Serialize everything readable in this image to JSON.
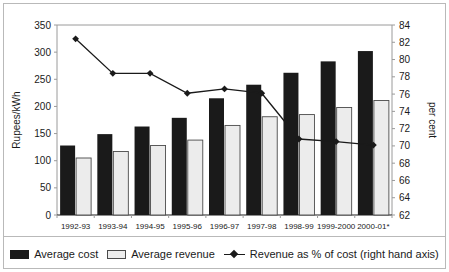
{
  "chart_data": {
    "type": "bar",
    "title": "",
    "xlabel": "",
    "ylabel": "Rupees/kWh",
    "y2label": "per cent",
    "categories": [
      "1992-93",
      "1993-94",
      "1994-95",
      "1995-96",
      "1996-97",
      "1997-98",
      "1998-99",
      "1999-2000",
      "2000-01*"
    ],
    "ylim": [
      0,
      350
    ],
    "yticks": [
      0,
      50,
      100,
      150,
      200,
      250,
      300,
      350
    ],
    "y2lim": [
      62,
      84
    ],
    "y2ticks": [
      62,
      64,
      66,
      68,
      70,
      72,
      74,
      76,
      78,
      80,
      82,
      84
    ],
    "grid": false,
    "legend_position": "bottom",
    "series": [
      {
        "name": "Average cost",
        "kind": "bar",
        "axis": "left",
        "color": "#1a1a1a",
        "values": [
          128,
          149,
          163,
          179,
          215,
          240,
          262,
          283,
          302
        ]
      },
      {
        "name": "Average revenue",
        "kind": "bar",
        "axis": "left",
        "color": "#ececec",
        "values": [
          105,
          117,
          128,
          138,
          165,
          181,
          185,
          198,
          211
        ]
      },
      {
        "name": "Revenue as % of cost (right hand axis)",
        "kind": "line",
        "axis": "right",
        "color": "#1a1a1a",
        "marker": "diamond",
        "values": [
          82.4,
          78.4,
          78.4,
          76.1,
          76.6,
          76.1,
          70.8,
          70.5,
          70.1
        ]
      }
    ]
  },
  "legend": {
    "items": [
      {
        "label": "Average cost",
        "swatch": "dark-bar-swatch"
      },
      {
        "label": "Average revenue",
        "swatch": "light-bar-swatch"
      },
      {
        "label": "Revenue as % of cost (right hand axis)",
        "swatch": "line-marker-swatch"
      }
    ]
  },
  "colors": {
    "cost_bar": "#1a1a1a",
    "revenue_bar": "#ececec",
    "revenue_bar_border": "#4a4a4a",
    "line": "#1a1a1a",
    "frame": "#b9b9b9",
    "axis": "#9a9a9a",
    "text": "#1a1a1a",
    "background": "#ffffff"
  }
}
